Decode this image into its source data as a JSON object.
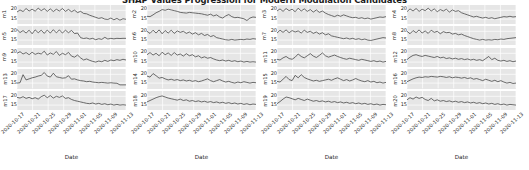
{
  "chart_data": {
    "type": "line",
    "title": "SHAP Values Progression for Modern Modulation Candidates",
    "xlabel": "Date",
    "ylabel": "",
    "grid": true,
    "legend": "none",
    "layout": {
      "rows": 5,
      "cols": 4,
      "shared_x": true
    },
    "ylim": [
      12,
      23
    ],
    "yticks": [
      "20",
      "15"
    ],
    "x": [
      "2020-10-17",
      "2020-10-21",
      "2020-10-25",
      "2020-10-29",
      "2020-11-01",
      "2020-11-05",
      "2020-11-09",
      "2020-11-13"
    ],
    "xtick_labels": [
      "2020-10-17",
      "2020-10-21",
      "2020-10-25",
      "2020-10-29",
      "2020-11-01",
      "2020-11-05",
      "2020-11-09",
      "2020-11-13"
    ],
    "columns": [
      {
        "xlabel": "Date",
        "panels": [
          {
            "name": "m1",
            "values": [
              19.0,
              20.2,
              19.3,
              21.0,
              19.6,
              20.6,
              19.5,
              21.2,
              19.8,
              20.9,
              19.4,
              20.8,
              19.3,
              20.6,
              19.6,
              21.0,
              19.4,
              20.5,
              19.2,
              20.1,
              18.7,
              19.4,
              18.2,
              18.0,
              17.2,
              16.6,
              16.0,
              15.4,
              15.8,
              15.0,
              14.8,
              15.6,
              14.6,
              15.4,
              14.4,
              15.2,
              14.9
            ]
          },
          {
            "name": "m5",
            "values": [
              21.0,
              19.3,
              20.4,
              19.0,
              20.6,
              18.6,
              20.8,
              19.2,
              20.6,
              18.8,
              20.7,
              19.0,
              20.9,
              19.1,
              20.8,
              19.0,
              20.6,
              19.2,
              20.5,
              18.7,
              19.0,
              16.4,
              15.9,
              16.2,
              15.6,
              16.0,
              15.2,
              15.8,
              15.4,
              16.6,
              15.6,
              16.0,
              15.7,
              16.0,
              15.9,
              16.0,
              16.0
            ]
          },
          {
            "name": "m9",
            "values": [
              20.0,
              20.9,
              19.6,
              20.4,
              19.2,
              20.6,
              19.4,
              20.1,
              19.6,
              21.2,
              19.0,
              20.2,
              19.4,
              21.0,
              18.8,
              20.0,
              19.2,
              20.5,
              18.4,
              17.8,
              19.0,
              17.4,
              16.2,
              16.8,
              16.0,
              15.4,
              15.0,
              15.6,
              15.2,
              16.0,
              15.4,
              16.2,
              15.8,
              16.4,
              16.0,
              16.6,
              16.2
            ]
          },
          {
            "name": "m13",
            "values": [
              15.0,
              15.2,
              19.8,
              16.8,
              17.4,
              18.0,
              18.4,
              19.0,
              19.4,
              21.0,
              19.0,
              18.4,
              20.6,
              18.6,
              18.2,
              17.8,
              18.0,
              19.2,
              17.2,
              17.4,
              16.8,
              16.4,
              16.2,
              15.8,
              16.0,
              15.6,
              15.4,
              15.2,
              15.4,
              15.2,
              15.0,
              15.2,
              15.0,
              14.9,
              14.0,
              14.0,
              14.0
            ]
          },
          {
            "name": "m17",
            "values": [
              19.4,
              19.0,
              19.8,
              18.8,
              19.4,
              18.6,
              19.2,
              18.4,
              19.8,
              20.6,
              19.2,
              20.4,
              19.0,
              20.0,
              19.4,
              20.2,
              18.8,
              19.2,
              18.2,
              17.6,
              17.2,
              16.8,
              16.4,
              16.0,
              15.8,
              16.2,
              15.6,
              16.0,
              15.4,
              15.8,
              15.2,
              15.6,
              15.0,
              15.4,
              15.0,
              15.2,
              15.0
            ]
          }
        ]
      },
      {
        "xlabel": "Date",
        "panels": [
          {
            "name": "m2",
            "values": [
              16.6,
              16.4,
              17.4,
              18.6,
              19.4,
              20.4,
              20.0,
              20.6,
              20.2,
              19.8,
              19.4,
              18.8,
              18.6,
              18.4,
              18.8,
              18.6,
              18.4,
              18.2,
              18.0,
              17.6,
              17.2,
              17.8,
              16.8,
              17.4,
              16.2,
              15.6,
              16.8,
              17.6,
              16.4,
              15.8,
              16.0,
              15.6,
              15.2,
              14.2,
              15.6,
              16.2,
              16.0
            ]
          },
          {
            "name": "m6",
            "values": [
              20.0,
              18.8,
              20.6,
              19.0,
              20.8,
              18.6,
              20.4,
              19.0,
              20.6,
              18.8,
              20.2,
              19.4,
              20.0,
              18.8,
              19.6,
              18.4,
              19.2,
              18.0,
              18.8,
              17.6,
              18.2,
              17.0,
              17.6,
              16.4,
              16.0,
              15.6,
              15.2,
              15.0,
              15.4,
              15.0,
              15.2,
              15.4,
              15.2,
              15.6,
              15.4,
              15.8,
              15.6
            ]
          },
          {
            "name": "m10",
            "values": [
              19.2,
              20.4,
              19.0,
              20.0,
              18.6,
              20.6,
              19.2,
              20.2,
              18.8,
              20.4,
              19.0,
              19.6,
              18.4,
              19.8,
              18.6,
              19.2,
              18.0,
              18.6,
              17.4,
              18.0,
              17.2,
              17.6,
              16.8,
              16.2,
              15.8,
              16.2,
              15.6,
              16.0,
              15.4,
              15.8,
              15.2,
              15.6,
              15.0,
              15.4,
              15.0,
              15.2,
              15.0
            ]
          },
          {
            "name": "m14",
            "values": [
              19.0,
              18.4,
              20.4,
              19.2,
              17.8,
              18.2,
              17.4,
              16.8,
              17.2,
              16.6,
              17.0,
              16.4,
              16.8,
              16.2,
              16.6,
              16.0,
              16.4,
              15.8,
              16.2,
              16.8,
              17.4,
              16.4,
              15.8,
              16.4,
              17.0,
              16.2,
              15.6,
              16.0,
              15.4,
              15.0,
              15.6,
              15.2,
              15.8,
              15.4,
              15.0,
              15.4,
              15.2
            ]
          },
          {
            "name": "m18",
            "values": [
              16.8,
              17.6,
              18.4,
              19.2,
              19.8,
              20.2,
              19.6,
              19.0,
              18.6,
              18.2,
              17.8,
              18.4,
              17.6,
              18.0,
              17.2,
              17.6,
              17.0,
              17.4,
              16.8,
              17.2,
              16.6,
              17.0,
              16.4,
              16.8,
              16.2,
              16.6,
              16.0,
              16.4,
              15.8,
              16.2,
              15.6,
              16.0,
              15.4,
              15.8,
              15.2,
              15.6,
              15.4
            ]
          }
        ]
      },
      {
        "xlabel": "Date",
        "panels": [
          {
            "name": "m3",
            "values": [
              19.6,
              20.8,
              19.4,
              21.0,
              19.8,
              20.6,
              19.2,
              21.2,
              19.6,
              20.8,
              19.4,
              20.4,
              19.0,
              20.2,
              18.8,
              19.6,
              18.4,
              17.6,
              17.0,
              16.4,
              17.2,
              16.6,
              17.4,
              16.8,
              16.2,
              15.8,
              16.0,
              15.4,
              15.8,
              15.2,
              15.6,
              15.0,
              15.4,
              15.8,
              16.2,
              16.0,
              16.4
            ]
          },
          {
            "name": "m7",
            "values": [
              19.0,
              20.6,
              19.4,
              20.8,
              19.2,
              20.4,
              19.6,
              20.2,
              19.0,
              20.6,
              19.4,
              20.0,
              18.8,
              19.6,
              18.4,
              19.2,
              18.0,
              18.6,
              17.4,
              17.0,
              16.6,
              16.2,
              15.8,
              16.2,
              15.6,
              16.0,
              15.4,
              15.8,
              15.2,
              15.6,
              15.0,
              14.8,
              15.2,
              15.6,
              16.0,
              16.4,
              16.2
            ]
          },
          {
            "name": "m11",
            "values": [
              16.6,
              16.2,
              17.4,
              18.2,
              17.0,
              16.6,
              17.8,
              19.6,
              18.2,
              17.4,
              18.6,
              19.8,
              18.4,
              17.6,
              18.8,
              20.2,
              18.6,
              17.8,
              18.4,
              19.0,
              18.2,
              17.6,
              17.0,
              16.6,
              17.2,
              16.8,
              16.4,
              16.0,
              16.6,
              16.2,
              15.8,
              15.4,
              15.8,
              15.2,
              15.6,
              15.0,
              15.4
            ]
          },
          {
            "name": "m15",
            "values": [
              16.0,
              15.6,
              17.2,
              18.8,
              17.0,
              16.4,
              19.4,
              18.0,
              19.8,
              18.2,
              17.4,
              16.8,
              16.2,
              16.6,
              16.0,
              16.4,
              16.8,
              17.2,
              16.6,
              17.4,
              18.0,
              17.2,
              16.4,
              17.0,
              16.2,
              16.8,
              17.6,
              16.8,
              16.2,
              15.8,
              16.4,
              15.6,
              16.0,
              15.2,
              15.6,
              15.0,
              15.4
            ]
          },
          {
            "name": "m19",
            "values": [
              15.8,
              17.0,
              18.4,
              19.6,
              19.2,
              18.6,
              18.0,
              18.8,
              18.2,
              17.6,
              18.4,
              17.8,
              17.2,
              17.6,
              17.0,
              17.4,
              16.8,
              17.2,
              16.6,
              17.0,
              16.4,
              16.8,
              16.2,
              16.6,
              16.0,
              16.4,
              15.8,
              16.2,
              15.6,
              16.0,
              15.4,
              15.8,
              15.2,
              15.6,
              15.0,
              15.4,
              15.2
            ]
          }
        ]
      },
      {
        "xlabel": "Date",
        "panels": [
          {
            "name": "m4",
            "values": [
              19.2,
              20.8,
              19.6,
              21.0,
              19.4,
              20.6,
              19.8,
              21.2,
              19.6,
              20.8,
              19.2,
              20.4,
              19.6,
              20.6,
              19.0,
              20.2,
              19.4,
              19.8,
              18.6,
              18.0,
              17.4,
              16.8,
              16.2,
              16.6,
              16.0,
              15.6,
              16.0,
              15.4,
              15.8,
              15.2,
              15.6,
              16.0,
              16.4,
              16.2,
              16.6,
              16.2,
              16.4
            ]
          },
          {
            "name": "m8",
            "values": [
              20.0,
              18.6,
              20.4,
              19.2,
              20.8,
              19.0,
              20.2,
              18.8,
              20.6,
              19.4,
              20.0,
              18.6,
              19.8,
              19.2,
              19.4,
              18.4,
              18.8,
              18.0,
              18.4,
              17.6,
              17.0,
              16.4,
              15.8,
              15.4,
              15.0,
              15.4,
              15.0,
              15.2,
              15.0,
              15.4,
              15.2,
              15.6,
              15.4,
              15.8,
              16.0,
              16.2,
              16.4
            ]
          },
          {
            "name": "m12",
            "values": [
              16.4,
              17.8,
              18.8,
              19.2,
              18.6,
              18.2,
              18.8,
              18.4,
              18.0,
              17.6,
              18.2,
              17.4,
              17.8,
              17.0,
              17.4,
              16.8,
              17.2,
              16.6,
              17.0,
              16.4,
              16.8,
              16.2,
              16.6,
              16.0,
              16.4,
              15.8,
              17.0,
              18.2,
              16.4,
              17.2,
              16.0,
              15.6,
              16.0,
              15.4,
              15.8,
              15.2,
              15.6
            ]
          },
          {
            "name": "m16",
            "values": [
              15.8,
              16.6,
              17.4,
              18.0,
              18.4,
              18.2,
              18.6,
              18.4,
              18.8,
              18.6,
              18.4,
              18.8,
              18.6,
              18.2,
              18.6,
              18.0,
              18.4,
              18.2,
              17.8,
              18.2,
              17.6,
              18.0,
              17.2,
              17.6,
              17.0,
              16.4,
              17.2,
              16.6,
              16.0,
              16.6,
              15.8,
              16.4,
              15.6,
              15.0,
              15.4,
              14.8,
              15.0
            ]
          },
          {
            "name": "m20",
            "values": [
              18.0,
              19.2,
              18.4,
              19.6,
              18.8,
              19.4,
              18.2,
              17.6,
              18.8,
              17.4,
              18.0,
              17.2,
              17.6,
              17.0,
              17.4,
              16.8,
              17.2,
              16.6,
              17.0,
              16.4,
              16.8,
              16.2,
              16.6,
              16.0,
              16.4,
              15.8,
              16.2,
              15.6,
              16.0,
              15.4,
              15.8,
              15.2,
              15.6,
              15.0,
              15.4,
              15.2,
              15.0
            ]
          }
        ]
      }
    ]
  }
}
